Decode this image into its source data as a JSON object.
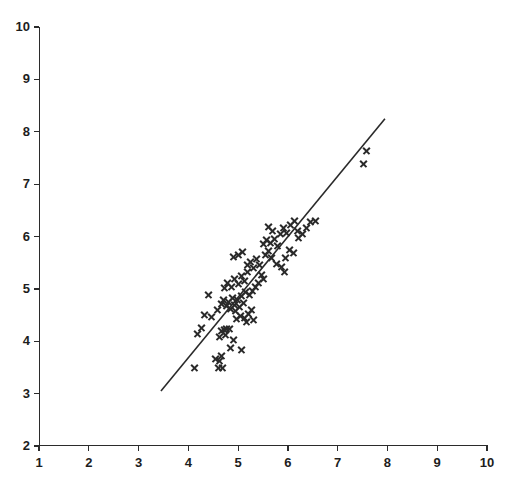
{
  "chart_data": {
    "type": "scatter",
    "title": "",
    "subtitle": "",
    "xlabel": "",
    "ylabel": "",
    "xlim": [
      1,
      10
    ],
    "ylim": [
      2,
      10
    ],
    "xticks": [
      1,
      2,
      3,
      4,
      5,
      6,
      7,
      8,
      9,
      10
    ],
    "yticks": [
      2,
      3,
      4,
      5,
      6,
      7,
      8,
      9,
      10
    ],
    "xtick_labels": [
      "1",
      "2",
      "3",
      "4",
      "5",
      "6",
      "7",
      "8",
      "9",
      "10"
    ],
    "ytick_labels": [
      "2",
      "3",
      "4",
      "5",
      "6",
      "7",
      "8",
      "9",
      "10"
    ],
    "grid": false,
    "legend": null,
    "marker": "x",
    "marker_color": "#2a2a2a",
    "line_color": "#2a2a2a",
    "background_color": "#ffffff",
    "axis_color": "#2b2b2b",
    "fit_line": {
      "label": "",
      "x_start": 3.45,
      "y_start": 3.05,
      "x_end": 7.95,
      "y_end": 8.25
    },
    "series": [
      {
        "name": "observations",
        "points": [
          [
            4.4,
            4.9
          ],
          [
            4.18,
            4.15
          ],
          [
            4.33,
            4.52
          ],
          [
            4.47,
            4.47
          ],
          [
            4.26,
            4.27
          ],
          [
            4.12,
            3.49
          ],
          [
            4.55,
            3.67
          ],
          [
            4.62,
            3.64
          ],
          [
            4.66,
            3.72
          ],
          [
            4.6,
            3.49
          ],
          [
            4.69,
            3.5
          ],
          [
            4.72,
            4.22
          ],
          [
            4.77,
            4.25
          ],
          [
            4.67,
            4.2
          ],
          [
            4.82,
            4.24
          ],
          [
            4.74,
            4.12
          ],
          [
            4.63,
            4.1
          ],
          [
            4.9,
            4.03
          ],
          [
            4.85,
            3.88
          ],
          [
            5.06,
            3.85
          ],
          [
            4.58,
            4.6
          ],
          [
            4.66,
            4.73
          ],
          [
            4.7,
            4.8
          ],
          [
            4.76,
            4.68
          ],
          [
            4.8,
            4.75
          ],
          [
            4.84,
            4.62
          ],
          [
            4.88,
            4.84
          ],
          [
            4.92,
            4.7
          ],
          [
            4.95,
            4.58
          ],
          [
            4.99,
            4.79
          ],
          [
            5.03,
            4.66
          ],
          [
            5.07,
            4.88
          ],
          [
            5.1,
            4.74
          ],
          [
            5.14,
            4.95
          ],
          [
            4.72,
            5.02
          ],
          [
            4.79,
            5.12
          ],
          [
            4.86,
            5.05
          ],
          [
            4.93,
            5.2
          ],
          [
            5.0,
            5.1
          ],
          [
            5.06,
            5.26
          ],
          [
            5.12,
            5.16
          ],
          [
            5.18,
            5.33
          ],
          [
            4.96,
            4.44
          ],
          [
            5.04,
            4.5
          ],
          [
            5.12,
            4.46
          ],
          [
            5.2,
            4.53
          ],
          [
            5.26,
            4.6
          ],
          [
            5.16,
            4.38
          ],
          [
            5.3,
            4.42
          ],
          [
            5.22,
            4.9
          ],
          [
            5.28,
            4.97
          ],
          [
            5.34,
            5.05
          ],
          [
            5.18,
            5.46
          ],
          [
            5.24,
            5.52
          ],
          [
            5.3,
            5.4
          ],
          [
            5.36,
            5.58
          ],
          [
            5.42,
            5.47
          ],
          [
            4.9,
            5.62
          ],
          [
            5.0,
            5.66
          ],
          [
            5.08,
            5.72
          ],
          [
            5.46,
            5.28
          ],
          [
            5.52,
            5.2
          ],
          [
            5.4,
            5.12
          ],
          [
            5.56,
            5.66
          ],
          [
            5.62,
            5.74
          ],
          [
            5.68,
            5.6
          ],
          [
            5.5,
            5.86
          ],
          [
            5.58,
            5.94
          ],
          [
            5.66,
            5.88
          ],
          [
            5.74,
            5.96
          ],
          [
            5.8,
            5.82
          ],
          [
            5.86,
            6.05
          ],
          [
            5.7,
            6.12
          ],
          [
            5.62,
            6.2
          ],
          [
            5.92,
            6.18
          ],
          [
            5.98,
            6.08
          ],
          [
            6.06,
            6.22
          ],
          [
            6.14,
            6.3
          ],
          [
            6.2,
            6.12
          ],
          [
            6.04,
            5.76
          ],
          [
            6.12,
            5.7
          ],
          [
            5.96,
            5.6
          ],
          [
            6.22,
            5.98
          ],
          [
            6.3,
            6.05
          ],
          [
            6.38,
            6.18
          ],
          [
            6.46,
            6.28
          ],
          [
            6.56,
            6.3
          ],
          [
            5.88,
            5.42
          ],
          [
            5.78,
            5.48
          ],
          [
            5.94,
            5.34
          ],
          [
            7.58,
            7.65
          ],
          [
            7.52,
            7.4
          ]
        ]
      }
    ]
  }
}
